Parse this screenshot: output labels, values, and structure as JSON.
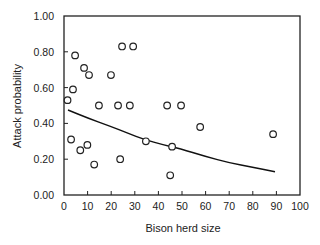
{
  "chart_data": {
    "type": "scatter",
    "title": "",
    "xlabel": "Bison herd size",
    "ylabel": "Attack probability",
    "xlim": [
      0,
      100
    ],
    "ylim": [
      0,
      1
    ],
    "x_ticks": [
      0,
      10,
      20,
      30,
      40,
      50,
      60,
      70,
      80,
      90,
      100
    ],
    "x_tick_labels": [
      "0",
      "10",
      "20",
      "30",
      "40",
      "50",
      "60",
      "70",
      "80",
      "90",
      "100"
    ],
    "y_ticks": [
      0,
      0.2,
      0.4,
      0.6,
      0.8,
      1.0
    ],
    "y_tick_labels": [
      "0.00",
      "0.20",
      "0.40",
      "0.60",
      "0.80",
      "1.00"
    ],
    "grid": false,
    "legend": "none",
    "series": [
      {
        "name": "observed",
        "kind": "scatter",
        "marker": "open-circle",
        "points": [
          {
            "x": 1.5,
            "y": 0.53
          },
          {
            "x": 3.0,
            "y": 0.31
          },
          {
            "x": 3.8,
            "y": 0.59
          },
          {
            "x": 4.7,
            "y": 0.78
          },
          {
            "x": 6.9,
            "y": 0.25
          },
          {
            "x": 8.5,
            "y": 0.71
          },
          {
            "x": 9.9,
            "y": 0.28
          },
          {
            "x": 10.6,
            "y": 0.67
          },
          {
            "x": 12.8,
            "y": 0.17
          },
          {
            "x": 14.8,
            "y": 0.5
          },
          {
            "x": 19.9,
            "y": 0.67
          },
          {
            "x": 22.9,
            "y": 0.5
          },
          {
            "x": 23.8,
            "y": 0.2
          },
          {
            "x": 24.6,
            "y": 0.83
          },
          {
            "x": 27.9,
            "y": 0.5
          },
          {
            "x": 29.3,
            "y": 0.83
          },
          {
            "x": 34.7,
            "y": 0.3
          },
          {
            "x": 43.7,
            "y": 0.5
          },
          {
            "x": 45.0,
            "y": 0.11
          },
          {
            "x": 45.8,
            "y": 0.27
          },
          {
            "x": 49.6,
            "y": 0.5
          },
          {
            "x": 57.7,
            "y": 0.38
          },
          {
            "x": 88.6,
            "y": 0.34
          }
        ]
      },
      {
        "name": "fitted",
        "kind": "line",
        "points": [
          {
            "x": 1.7,
            "y": 0.475
          },
          {
            "x": 10,
            "y": 0.43
          },
          {
            "x": 19.5,
            "y": 0.385
          },
          {
            "x": 27,
            "y": 0.345
          },
          {
            "x": 34,
            "y": 0.31
          },
          {
            "x": 42,
            "y": 0.28
          },
          {
            "x": 49,
            "y": 0.26
          },
          {
            "x": 60,
            "y": 0.215
          },
          {
            "x": 70,
            "y": 0.18
          },
          {
            "x": 80,
            "y": 0.155
          },
          {
            "x": 89.4,
            "y": 0.13
          }
        ]
      }
    ]
  }
}
